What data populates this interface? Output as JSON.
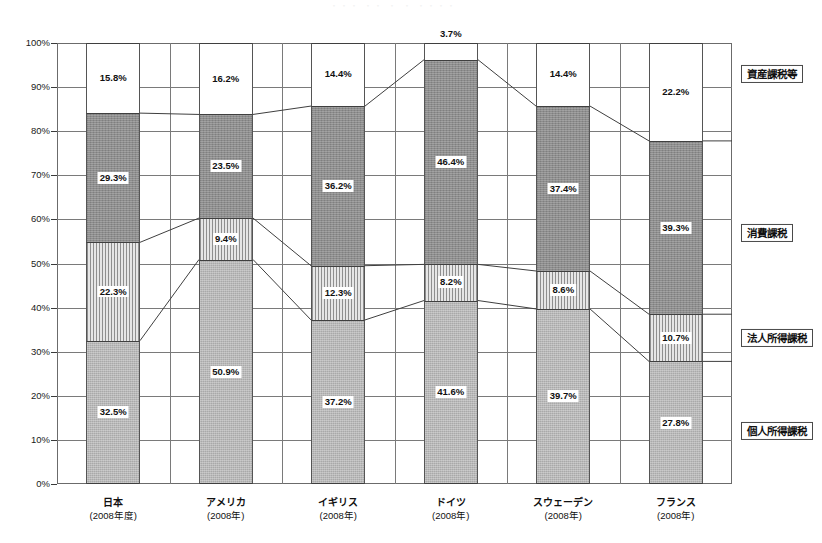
{
  "chart_data": {
    "type": "bar",
    "subtype": "100% stacked bar with connector lines",
    "title": "",
    "xlabel": "",
    "ylabel": "",
    "ylim": [
      0,
      100
    ],
    "ytick_labels": [
      "0%",
      "10%",
      "20%",
      "30%",
      "40%",
      "50%",
      "60%",
      "70%",
      "80%",
      "90%",
      "100%"
    ],
    "ytick_values": [
      0,
      10,
      20,
      30,
      40,
      50,
      60,
      70,
      80,
      90,
      100
    ],
    "grid": true,
    "legend_position": "right",
    "stack_order_bottom_to_top": [
      "個人所得課税",
      "法人所得課税",
      "消費課税",
      "資産課税等"
    ],
    "categories": [
      "日本",
      "アメリカ",
      "イギリス",
      "ドイツ",
      "スウェーデン",
      "フランス"
    ],
    "category_years": [
      "(2008年度)",
      "(2008年)",
      "(2008年)",
      "(2008年)",
      "(2008年)",
      "(2008年)"
    ],
    "series": [
      {
        "name": "個人所得課税",
        "values": [
          32.5,
          50.9,
          37.2,
          41.6,
          39.7,
          27.8
        ]
      },
      {
        "name": "法人所得課税",
        "values": [
          22.3,
          9.4,
          12.3,
          8.2,
          8.6,
          10.7
        ]
      },
      {
        "name": "消費課税",
        "values": [
          29.3,
          23.5,
          36.2,
          46.4,
          37.4,
          39.3
        ]
      },
      {
        "name": "資産課税等",
        "values": [
          15.8,
          16.2,
          14.4,
          3.7,
          14.4,
          22.2
        ]
      }
    ],
    "value_label_suffix": "%"
  },
  "legend": {
    "items": [
      {
        "label": "資産課税等",
        "key": "asset"
      },
      {
        "label": "消費課税",
        "key": "consumption"
      },
      {
        "label": "法人所得課税",
        "key": "corporate"
      },
      {
        "label": "個人所得課税",
        "key": "personal"
      }
    ]
  },
  "colors": {
    "personal": "#a9a9a9",
    "corporate": "#dadada",
    "consumption": "#8d8d8d",
    "asset": "#ffffff",
    "axis": "#6b6b6b",
    "grid": "#7a7a7a",
    "text": "#111111"
  },
  "top_fragment": "・・・ ・・ ・ ・ ・・・・"
}
